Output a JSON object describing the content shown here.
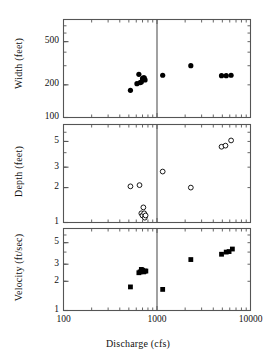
{
  "figure": {
    "xlabel": "Discharge (cfs)",
    "x_tick_labels": [
      "100",
      "1000",
      "10000"
    ],
    "x_tick_values": [
      100,
      1000,
      10000
    ],
    "xlim": [
      100,
      10000
    ],
    "divider_x": 1000,
    "x_scale": "log",
    "y_scale": "log",
    "marker_color": "#000000",
    "axis_color": "#555555"
  },
  "chart_data": [
    {
      "type": "scatter",
      "title": "",
      "panel": "width",
      "xlabel": "Discharge (cfs)",
      "ylabel": "Width (feet)",
      "xlim": [
        100,
        10000
      ],
      "ylim": [
        100,
        800
      ],
      "x_scale": "log",
      "y_scale": "log",
      "grid": false,
      "legend": "none",
      "y_tick_labels": [
        "500",
        "200",
        "100"
      ],
      "y_tick_values": [
        500,
        200,
        100
      ],
      "marker": "filled-circle",
      "x": [
        520,
        610,
        640,
        660,
        680,
        700,
        715,
        730,
        745,
        1150,
        2300,
        4900,
        5500,
        6200
      ],
      "y": [
        178,
        205,
        250,
        210,
        212,
        228,
        232,
        232,
        222,
        245,
        300,
        243,
        243,
        245
      ]
    },
    {
      "type": "scatter",
      "title": "",
      "panel": "depth",
      "xlabel": "Discharge (cfs)",
      "ylabel": "Depth (feet)",
      "xlim": [
        100,
        10000
      ],
      "ylim": [
        1,
        7
      ],
      "x_scale": "log",
      "y_scale": "log",
      "grid": false,
      "legend": "none",
      "y_tick_labels": [
        "5",
        "3",
        "2",
        "1"
      ],
      "y_tick_values": [
        5,
        3,
        2,
        1
      ],
      "marker": "open-circle",
      "x": [
        520,
        650,
        680,
        700,
        715,
        730,
        740,
        755,
        1150,
        2300,
        4900,
        5400,
        6200
      ],
      "y": [
        2.05,
        2.1,
        1.2,
        1.15,
        1.35,
        1.2,
        1.1,
        1.15,
        2.75,
        2.0,
        4.5,
        4.6,
        5.1
      ]
    },
    {
      "type": "scatter",
      "title": "",
      "panel": "velocity",
      "xlabel": "Discharge (cfs)",
      "ylabel": "Velocity (ft/sec)",
      "xlim": [
        100,
        10000
      ],
      "ylim": [
        1,
        7
      ],
      "x_scale": "log",
      "y_scale": "log",
      "grid": false,
      "legend": "none",
      "y_tick_labels": [
        "5",
        "3",
        "2",
        "1"
      ],
      "y_tick_values": [
        5,
        3,
        2,
        1
      ],
      "marker": "filled-square",
      "x": [
        520,
        640,
        660,
        680,
        700,
        720,
        740,
        760,
        1150,
        2300,
        4900,
        5500,
        5900,
        6400
      ],
      "y": [
        1.75,
        2.45,
        2.5,
        2.65,
        2.6,
        2.5,
        2.55,
        2.55,
        1.65,
        3.35,
        3.8,
        4.0,
        4.05,
        4.3
      ]
    }
  ]
}
